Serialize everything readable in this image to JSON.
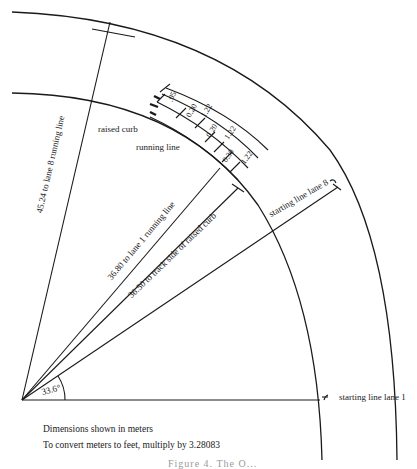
{
  "figure": {
    "labels": {
      "raised_curb": "raised curb",
      "running_line": "running line",
      "lane8_running": "45.24 to lane 8 running line",
      "lane1_running": "36.80 to lane 1 running line",
      "raised_curb_radius": "36.50 to track side of raised curb",
      "start_lane8": "starting line lane 8",
      "start_lane1": "starting line lane 1",
      "angle": "33.6°"
    },
    "dimensions": {
      "d1": ".05",
      "d2": "0.20",
      "d3": "1.22",
      "d4": "0.20",
      "d5": "1.22",
      "d6": "0.30",
      "d7": "1.22"
    },
    "notes": {
      "units": "Dimensions shown in meters",
      "conversion": "To convert meters to feet, multiply by 3.28083"
    },
    "caption": "Figure 4. The O..."
  }
}
